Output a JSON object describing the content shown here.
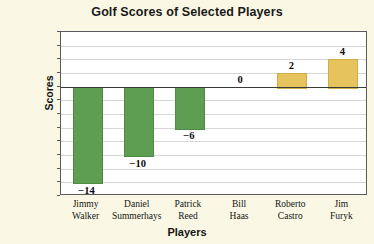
{
  "chart_data": {
    "type": "bar",
    "title": "Golf Scores of Selected Players",
    "xlabel": "Players",
    "ylabel": "Scores",
    "categories": [
      "Jimmy Walker",
      "Daniel Summerhays",
      "Patrick Reed",
      "Bill Haas",
      "Roberto Castro",
      "Jim Furyk"
    ],
    "category_lines": [
      [
        "Jimmy",
        "Walker"
      ],
      [
        "Daniel",
        "Summerhays"
      ],
      [
        "Patrick",
        "Reed"
      ],
      [
        "Bill",
        "Haas"
      ],
      [
        "Roberto",
        "Castro"
      ],
      [
        "Jim",
        "Furyk"
      ]
    ],
    "values": [
      -14,
      -10,
      -6,
      0,
      2,
      4
    ],
    "value_labels": [
      "−14",
      "−10",
      "−6",
      "0",
      "2",
      "4"
    ],
    "ylim": [
      -16,
      8
    ],
    "ytick_step": 2,
    "ytick_values": [
      8,
      6,
      4,
      2,
      0,
      -2,
      -4,
      -6,
      -8,
      -10,
      -12,
      -14,
      -16
    ],
    "ytick_labels": [
      "8",
      "6",
      "4",
      "2",
      "0 (par)",
      "−2",
      "−4",
      "−6",
      "−8",
      "−10",
      "−12",
      "−14",
      "−16"
    ],
    "grid": true,
    "legend": false,
    "bar_colors": {
      "negative": "#5e9e52",
      "positive": "#e6c35c"
    },
    "plot_background": "#ffffff",
    "figure_background": "#faf8e4",
    "zero_line_color": "#3a3a3a",
    "gridline_color": "#d7d7d7"
  }
}
